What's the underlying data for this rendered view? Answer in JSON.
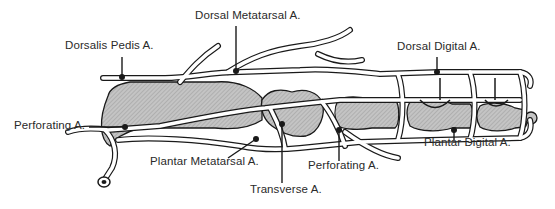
{
  "diagram": {
    "colors": {
      "line": "#1a1a1a",
      "bone_fill": "#b8b8b8",
      "vessel_fill": "#ffffff",
      "background": "#ffffff"
    },
    "labels": [
      {
        "id": "dorsal-metatarsal",
        "text": "Dorsal Metatarsal A."
      },
      {
        "id": "dorsalis-pedis",
        "text": "Dorsalis Pedis A."
      },
      {
        "id": "dorsal-digital",
        "text": "Dorsal Digital A."
      },
      {
        "id": "perforating-proximal",
        "text": "Perforating A."
      },
      {
        "id": "plantar-metatarsal",
        "text": "Plantar Metatarsal A."
      },
      {
        "id": "plantar-digital",
        "text": "Plantar Digital A."
      },
      {
        "id": "perforating-distal",
        "text": "Perforating A."
      },
      {
        "id": "transverse",
        "text": "Transverse A."
      }
    ]
  }
}
